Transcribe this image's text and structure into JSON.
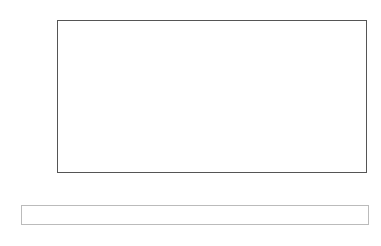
{
  "chart_data": {
    "type": "bar",
    "title": "",
    "xlabel": "",
    "ylabel": "Grade difference",
    "ylim": [
      0,
      3
    ],
    "yticks": [
      "0",
      "0.5",
      "1",
      "1.5",
      "2",
      "2.5",
      "3"
    ],
    "categories": [
      "Junior Cert",
      "Leaving Cert"
    ],
    "series": [
      {
        "name": "Low social activity",
        "color": "#ffffff",
        "values": [
          0.24,
          1.85
        ]
      },
      {
        "name": "Medium social activity",
        "color": "#5a5a5a",
        "values": [
          0.11,
          2.44
        ]
      },
      {
        "name": "High social activity",
        "color": "#262626",
        "values": [
          0.03,
          1.13
        ]
      }
    ],
    "grid": false,
    "legend_position": "bottom"
  }
}
